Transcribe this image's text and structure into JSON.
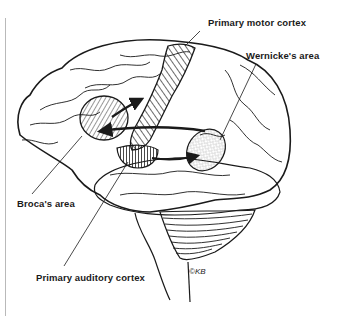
{
  "labels": {
    "motor": "Primary motor cortex",
    "wernicke": "Wernicke's area",
    "broca": "Broca's area",
    "auditory": "Primary auditory cortex"
  },
  "signature": "©KB",
  "colors": {
    "ink": "#1a1a1a",
    "background": "#ffffff",
    "frame_line": "#b9b9b9"
  },
  "regions": [
    {
      "name": "Primary motor cortex",
      "fill": "diagonal-hatch"
    },
    {
      "name": "Broca's area",
      "fill": "slanted-hatch"
    },
    {
      "name": "Primary auditory cortex",
      "fill": "vertical-hatch"
    },
    {
      "name": "Wernicke's area",
      "fill": "stipple"
    }
  ],
  "arrows": [
    {
      "from": "Broca's area",
      "to": "Primary motor cortex"
    },
    {
      "from": "Wernicke's area",
      "to": "Broca's area"
    },
    {
      "from": "Primary auditory cortex",
      "to": "Wernicke's area"
    }
  ]
}
